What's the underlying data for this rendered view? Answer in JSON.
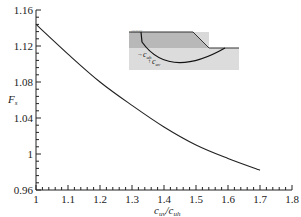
{
  "chart_data": {
    "type": "line",
    "title": "",
    "xlabel": "c_uv/c_uh",
    "ylabel": "F_s",
    "xlim": [
      1,
      1.8
    ],
    "ylim": [
      0.96,
      1.16
    ],
    "xticks": [
      "1",
      "1.1",
      "1.2",
      "1.3",
      "1.4",
      "1.5",
      "1.6",
      "1.7",
      "1.8"
    ],
    "yticks": [
      "0.96",
      "1",
      "1.04",
      "1.08",
      "1.12",
      "1.16"
    ],
    "grid": false,
    "legend": null,
    "series": [
      {
        "name": "F_s",
        "x": [
          1.0,
          1.1,
          1.2,
          1.3,
          1.4,
          1.5,
          1.6,
          1.7
        ],
        "values": [
          1.144,
          1.111,
          1.08,
          1.054,
          1.03,
          1.01,
          0.995,
          0.982
        ]
      }
    ],
    "inset": {
      "description": "slope cross-section with circular slip surface",
      "labels": [
        "c_uh",
        "c_uv"
      ]
    }
  },
  "labels": {
    "y_main": "F",
    "y_sub": "s",
    "x_num_main": "c",
    "x_num_sub": "uv",
    "x_slash": "/",
    "x_den_main": "c",
    "x_den_sub": "uh",
    "inset_h_main": "c",
    "inset_h_sub": "uh",
    "inset_v_main": "c",
    "inset_v_sub": "uv"
  }
}
